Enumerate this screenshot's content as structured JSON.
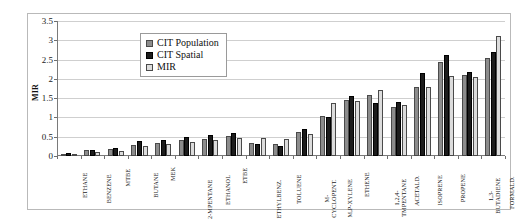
{
  "chart_data": {
    "type": "bar",
    "title": "",
    "xlabel": "",
    "ylabel": "MIR",
    "ylim": [
      0,
      3.5
    ],
    "yticks": [
      0,
      0.5,
      1,
      1.5,
      2,
      2.5,
      3,
      3.5
    ],
    "ytick_labels": [
      "0",
      "0.5",
      "1",
      "1.5",
      "2",
      "2.5",
      "3",
      "3.5"
    ],
    "grid": true,
    "legend_position": "upper-center",
    "categories": [
      "ETHANE",
      "BENZENE",
      "MTBE",
      "BUTANE",
      "MEK",
      "2-MPENTANE",
      "ETHANOL",
      "ETBE",
      "ETHYLBENZ.",
      "TOLUENE",
      "M-\nCYCLOPENT.",
      "M,P-XYLENE",
      "ETHENE",
      "1,2,4-\nTMPENTANE",
      "ACETALD.",
      "ISOPRENE",
      "PROPENE",
      "1,3-\nBUTADIENE",
      "FORMALD."
    ],
    "series": [
      {
        "name": "CIT Population",
        "color": "#8c8c8c",
        "values": [
          0.06,
          0.15,
          0.18,
          0.28,
          0.33,
          0.42,
          0.45,
          0.53,
          0.33,
          0.3,
          0.62,
          1.05,
          1.45,
          1.57,
          1.28,
          1.8,
          2.45,
          2.1,
          2.55
        ]
      },
      {
        "name": "CIT Spatial",
        "color": "#1c1c1c",
        "values": [
          0.08,
          0.16,
          0.2,
          0.38,
          0.42,
          0.5,
          0.55,
          0.6,
          0.3,
          0.27,
          0.7,
          1.02,
          1.55,
          1.38,
          1.4,
          2.15,
          2.62,
          2.18,
          2.7
        ]
      },
      {
        "name": "MIR",
        "color": "#dcdcdc",
        "values": [
          0.05,
          0.1,
          0.14,
          0.25,
          0.3,
          0.36,
          0.42,
          0.48,
          0.48,
          0.45,
          0.58,
          1.38,
          1.42,
          1.72,
          1.32,
          1.78,
          2.08,
          2.05,
          3.1
        ]
      }
    ]
  },
  "legend": {
    "items": [
      {
        "label": "CIT Population"
      },
      {
        "label": "CIT Spatial"
      },
      {
        "label": "MIR"
      }
    ]
  }
}
